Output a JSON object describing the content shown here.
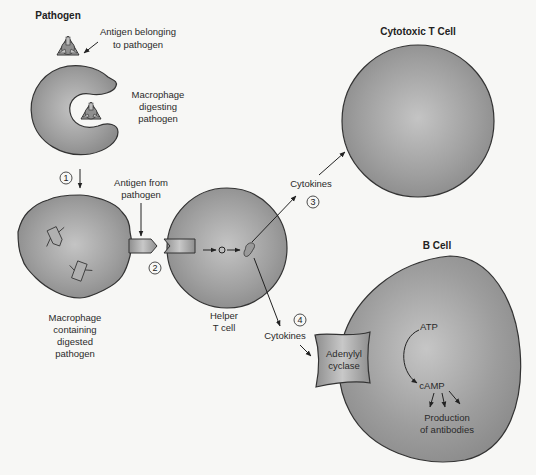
{
  "labels": {
    "pathogen": "Pathogen",
    "antigen_belonging_1": "Antigen belonging",
    "antigen_belonging_2": "to pathogen",
    "macrophage_digesting_1": "Macrophage",
    "macrophage_digesting_2": "digesting",
    "macrophage_digesting_3": "pathogen",
    "antigen_from_1": "Antigen from",
    "antigen_from_2": "pathogen",
    "macrophage_containing_1": "Macrophage",
    "macrophage_containing_2": "containing",
    "macrophage_containing_3": "digested",
    "macrophage_containing_4": "pathogen",
    "helper_1": "Helper",
    "helper_2": "T cell",
    "cytokines_3": "Cytokines",
    "cytokines_4": "Cytokines",
    "cytotoxic": "Cytotoxic T Cell",
    "bcell": "B Cell",
    "adenylyl_1": "Adenylyl",
    "adenylyl_2": "cyclase",
    "atp": "ATP",
    "camp": "cAMP",
    "production_1": "Production",
    "production_2": "of antibodies"
  },
  "steps": {
    "s1": "1",
    "s2": "2",
    "s3": "3",
    "s4": "4"
  },
  "colors": {
    "cell_fill_light": "#b9b9b9",
    "cell_fill_dark": "#8a8a8a",
    "outline": "#333333",
    "background": "#f7f7f5"
  }
}
